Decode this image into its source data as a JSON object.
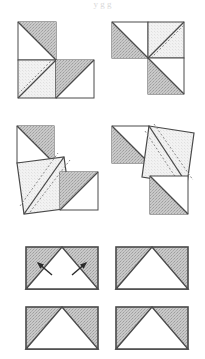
{
  "figure": {
    "top_cropped_text": "y  g g",
    "colors": {
      "stroke": "#4a4a4a",
      "gray_fill": "#bdbdbd",
      "light_fill": "#f1f1f1",
      "white_fill": "#ffffff",
      "dash_stroke": "#8a8a8a",
      "background": "#ffffff"
    },
    "layout": {
      "columns": 2,
      "rows": 3,
      "panel_count": 6
    },
    "panels": [
      {
        "id": "panel-top-left",
        "name": "L-shaped three-square dissection with dashed diagonal",
        "row": 1,
        "column": 1,
        "square_count": 3,
        "has_dashed_line": true,
        "dashed_line_count": 1,
        "has_arrows": false,
        "squares": [
          {
            "label": "upper-left-square",
            "shaded_half": "upper-right",
            "fill": "gray"
          },
          {
            "label": "lower-left-square",
            "shaded_half": "full",
            "fill": "light"
          },
          {
            "label": "lower-right-square",
            "shaded_half": "upper-left",
            "fill": "gray"
          }
        ]
      },
      {
        "id": "panel-top-right",
        "name": "L-shaped three-square dissection mirrored with dashed diagonal",
        "row": 1,
        "column": 2,
        "square_count": 3,
        "has_dashed_line": true,
        "dashed_line_count": 1,
        "has_arrows": false,
        "squares": [
          {
            "label": "upper-left-square",
            "shaded_half": "lower-left",
            "fill": "gray"
          },
          {
            "label": "upper-right-square",
            "shaded_half": "full",
            "fill": "light"
          },
          {
            "label": "lower-right-square",
            "shaded_half": "lower-left",
            "fill": "gray"
          }
        ]
      },
      {
        "id": "panel-middle-left",
        "name": "Rotated square dissection with two dashed diagonals",
        "row": 2,
        "column": 1,
        "square_count": 3,
        "has_dashed_line": true,
        "dashed_line_count": 2,
        "has_arrows": false,
        "squares": [
          {
            "label": "upper-left-square",
            "shaded_half": "upper-right",
            "fill": "gray"
          },
          {
            "label": "tilted-square",
            "shaded_half": "full",
            "fill": "light"
          },
          {
            "label": "lower-right-square",
            "shaded_half": "upper-left",
            "fill": "gray"
          }
        ]
      },
      {
        "id": "panel-middle-right",
        "name": "Rotated square dissection mirrored with two dashed diagonals",
        "row": 2,
        "column": 2,
        "square_count": 3,
        "has_dashed_line": true,
        "dashed_line_count": 2,
        "has_arrows": false,
        "squares": [
          {
            "label": "upper-left-square",
            "shaded_half": "lower-left",
            "fill": "gray"
          },
          {
            "label": "tilted-square",
            "shaded_half": "full",
            "fill": "light"
          },
          {
            "label": "lower-right-square",
            "shaded_half": "lower-left",
            "fill": "gray"
          }
        ]
      },
      {
        "id": "panel-bottom-left-upper",
        "name": "Rectangle with central white triangle and motion arrows",
        "row": 3,
        "column": 1,
        "shape": "rectangle",
        "inner_shape": "white-triangle",
        "has_dashed_line": false,
        "has_arrows": true,
        "arrow_count": 2,
        "arrows": [
          {
            "label": "left-arrow",
            "direction": "up-left"
          },
          {
            "label": "right-arrow",
            "direction": "up-right"
          }
        ]
      },
      {
        "id": "panel-bottom-right-upper",
        "name": "Rectangle with central white triangle",
        "row": 3,
        "column": 2,
        "shape": "rectangle",
        "inner_shape": "white-triangle",
        "has_dashed_line": false,
        "has_arrows": false,
        "arrow_count": 0
      },
      {
        "id": "panel-bottom-left-lower",
        "name": "Rectangle with central white triangle",
        "row": 4,
        "column": 1,
        "shape": "rectangle",
        "inner_shape": "white-triangle",
        "has_dashed_line": false,
        "has_arrows": false,
        "arrow_count": 0
      },
      {
        "id": "panel-bottom-right-lower",
        "name": "Rectangle with central white triangle",
        "row": 4,
        "column": 2,
        "shape": "rectangle",
        "inner_shape": "white-triangle",
        "has_dashed_line": false,
        "has_arrows": false,
        "arrow_count": 0
      }
    ]
  }
}
